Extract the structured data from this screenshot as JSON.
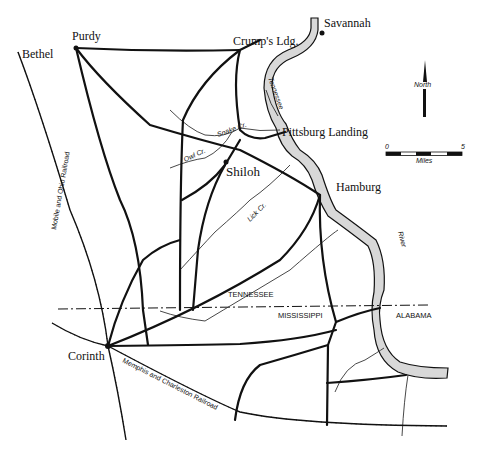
{
  "towns": {
    "purdy": "Purdy",
    "bethel": "Bethel",
    "crumps": "Crump's Ldg.",
    "savannah": "Savannah",
    "pittsburg": "Pittsburg Landing",
    "shiloh": "Shiloh",
    "hamburg": "Hamburg",
    "corinth": "Corinth"
  },
  "waterways": {
    "tennessee": "Tennessee",
    "river": "River",
    "snake": "Snake Cr.",
    "owl": "Owl Cr.",
    "lick": "Lick Cr."
  },
  "railroads": {
    "mobile_ohio": "Mobile and Ohio Railroad",
    "memphis_charleston": "Memphis and Charleston Railroad"
  },
  "states": {
    "tennessee": "TENNESSEE",
    "mississippi": "MISSISSIPPI",
    "alabama": "ALABAMA"
  },
  "compass": {
    "label": "North"
  },
  "scale": {
    "min": "0",
    "max": "5",
    "unit": "Miles"
  }
}
